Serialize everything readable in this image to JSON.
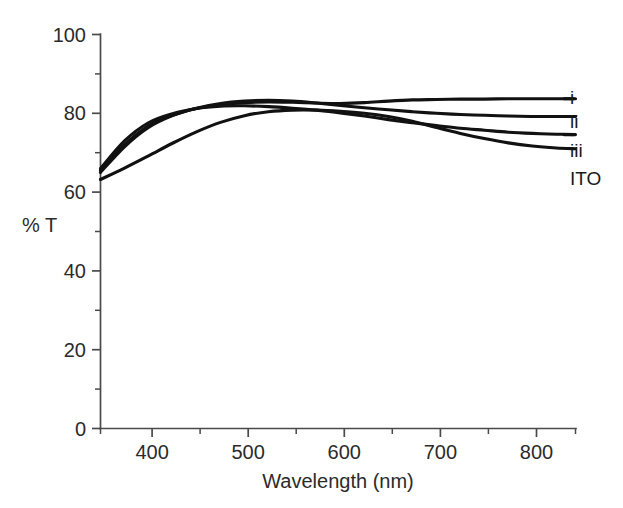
{
  "chart_data": {
    "type": "line",
    "title": "",
    "subtitle": "",
    "xlabel": "Wavelength (nm)",
    "ylabel": "% T",
    "xlim": [
      350,
      845
    ],
    "ylim": [
      0,
      100
    ],
    "grid": false,
    "legend_position": "right-inline-labels",
    "x_ticks_major": [
      400,
      500,
      600,
      700,
      800
    ],
    "x_ticks_major_labels": [
      "400",
      "500",
      "600",
      "700",
      "800"
    ],
    "x_ticks_minor": [
      350,
      450,
      550,
      650,
      750,
      845
    ],
    "y_ticks_major": [
      0,
      20,
      40,
      60,
      80,
      100
    ],
    "y_ticks_major_labels": [
      "0",
      "20",
      "40",
      "60",
      "80",
      "100"
    ],
    "y_ticks_minor": [
      10,
      30,
      50,
      70,
      90
    ],
    "x": [
      350,
      375,
      400,
      425,
      450,
      475,
      500,
      525,
      550,
      575,
      600,
      625,
      650,
      675,
      700,
      725,
      750,
      775,
      800,
      825,
      845
    ],
    "series": [
      {
        "name": "i",
        "label": "i",
        "label_value": 83.7,
        "values": [
          65.5,
          72.0,
          76.8,
          79.5,
          81.2,
          82.2,
          82.7,
          82.9,
          82.8,
          82.6,
          82.5,
          82.7,
          83.1,
          83.4,
          83.5,
          83.6,
          83.6,
          83.7,
          83.7,
          83.7,
          83.7
        ]
      },
      {
        "name": "ii",
        "label": "ii",
        "label_value": 79.2,
        "values": [
          65.0,
          71.5,
          76.4,
          79.4,
          81.3,
          82.5,
          83.1,
          83.3,
          83.1,
          82.6,
          82.0,
          81.4,
          80.9,
          80.4,
          80.0,
          79.7,
          79.5,
          79.3,
          79.2,
          79.2,
          79.2
        ]
      },
      {
        "name": "iii",
        "label": "iii",
        "label_value": 74.6,
        "values": [
          66.0,
          73.0,
          77.6,
          79.9,
          81.2,
          81.8,
          81.9,
          81.7,
          81.3,
          80.8,
          80.1,
          79.3,
          78.4,
          77.6,
          76.9,
          76.2,
          75.7,
          75.2,
          74.9,
          74.7,
          74.6
        ]
      },
      {
        "name": "ITO",
        "label": "ITO",
        "label_value": 71.0,
        "values": [
          63.2,
          66.1,
          69.2,
          72.4,
          75.3,
          77.7,
          79.4,
          80.4,
          80.8,
          80.8,
          80.5,
          80.0,
          79.2,
          78.0,
          76.4,
          74.9,
          73.6,
          72.5,
          71.7,
          71.2,
          71.0
        ]
      }
    ]
  },
  "colors": {
    "background": "#ffffff",
    "curve": "#111111",
    "axis": "#4a4a4a",
    "text": "#2b2b2b"
  }
}
